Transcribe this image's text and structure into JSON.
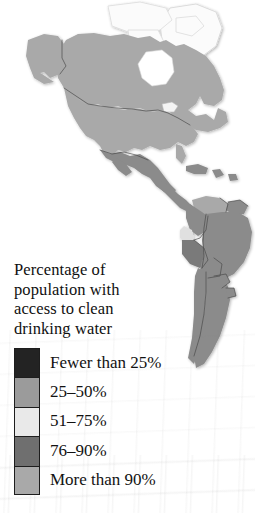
{
  "figure": {
    "kind": "thematic-choropleth-map",
    "region": "Americas",
    "background_color": "#ffffff"
  },
  "legend": {
    "title_lines": [
      "Percentage of",
      "population with",
      "access to clean",
      "drinking water"
    ],
    "title_text": "Percentage of population with access to clean drinking water",
    "border_color": "#1d1d1d",
    "classes": [
      {
        "label": "Fewer than 25%",
        "color": "#232323",
        "range_low": 0,
        "range_high": 25
      },
      {
        "label": "25–50%",
        "color": "#9b9b9b",
        "range_low": 25,
        "range_high": 50
      },
      {
        "label": "51–75%",
        "color": "#e9e9e9",
        "range_low": 51,
        "range_high": 75
      },
      {
        "label": "76–90%",
        "color": "#6f6f6f",
        "range_low": 76,
        "range_high": 90
      },
      {
        "label": "More than 90%",
        "color": "#a9a9a9",
        "range_low": 90,
        "range_high": 100
      }
    ]
  },
  "map": {
    "ocean_color": "#ffffff",
    "unshaded_land_color": "#f2f2f2",
    "border_line_color": "#4a4a4a",
    "coast_line_color": "#c9c9c9",
    "shaded_regions": [
      {
        "name": "Canada",
        "class_label": "More than 90%",
        "color": "#a9a9a9"
      },
      {
        "name": "United States",
        "class_label": "More than 90%",
        "color": "#a9a9a9"
      },
      {
        "name": "Alaska",
        "class_label": "More than 90%",
        "color": "#a9a9a9"
      },
      {
        "name": "Mexico",
        "class_label": "76–90%",
        "color": "#8b8b8b"
      },
      {
        "name": "Central America",
        "class_label": "76–90%",
        "color": "#8b8b8b"
      },
      {
        "name": "Caribbean islands",
        "class_label": "76–90%",
        "color": "#8b8b8b"
      },
      {
        "name": "Colombia",
        "class_label": "76–90%",
        "color": "#8b8b8b"
      },
      {
        "name": "Venezuela",
        "class_label": "More than 90%",
        "color": "#a9a9a9"
      },
      {
        "name": "Guianas",
        "class_label": "76–90%",
        "color": "#8b8b8b"
      },
      {
        "name": "Ecuador",
        "class_label": "51–75%",
        "color": "#e0e0e0"
      },
      {
        "name": "Peru",
        "class_label": "76–90%",
        "color": "#7a7a7a"
      },
      {
        "name": "Brazil",
        "class_label": "76–90%",
        "color": "#8b8b8b"
      },
      {
        "name": "Bolivia",
        "class_label": "76–90%",
        "color": "#8b8b8b"
      },
      {
        "name": "Chile",
        "class_label": "76–90%",
        "color": "#8b8b8b"
      },
      {
        "name": "Argentina",
        "class_label": "76–90%",
        "color": "#8b8b8b"
      },
      {
        "name": "Paraguay",
        "class_label": "76–90%",
        "color": "#8b8b8b"
      },
      {
        "name": "Uruguay",
        "class_label": "76–90%",
        "color": "#8b8b8b"
      }
    ],
    "unshaded_regions": [
      {
        "name": "Greenland"
      },
      {
        "name": "Canadian Arctic Archipelago"
      },
      {
        "name": "Iceland"
      }
    ]
  }
}
